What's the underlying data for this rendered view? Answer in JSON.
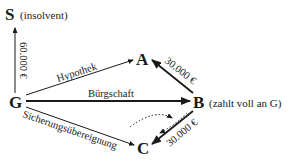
{
  "nodes": {
    "S": {
      "label": "S",
      "note": "(insolvent)"
    },
    "A": {
      "label": "A"
    },
    "G": {
      "label": "G"
    },
    "B": {
      "label": "B",
      "note": "(zahlt voll an G)"
    },
    "C": {
      "label": "C"
    }
  },
  "edges": {
    "g_s": {
      "from": "G",
      "to": "S",
      "label": "60.000 €"
    },
    "g_a": {
      "from": "G",
      "to": "A",
      "label": "Hypothek"
    },
    "g_b": {
      "from": "G",
      "to": "B",
      "label": "Bürgschaft"
    },
    "g_c": {
      "from": "G",
      "to": "C",
      "label": "Sicherungsübereignung"
    },
    "b_a": {
      "from": "B",
      "to": "A",
      "label": "30.000 €"
    },
    "b_c": {
      "from": "B",
      "to": "C",
      "label": "30.000 €"
    },
    "c_loop": {
      "from": "C",
      "to": "C",
      "style": "dotted",
      "label": ""
    }
  }
}
